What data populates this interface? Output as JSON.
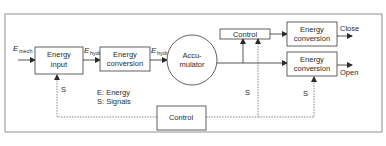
{
  "diagram": {
    "blocks": {
      "energy_input": {
        "line1": "Energy",
        "line2": "input"
      },
      "energy_conversion_1": {
        "line1": "Energy",
        "line2": "conversion"
      },
      "accumulator": {
        "line1": "Accu-",
        "line2": "mulator"
      },
      "control_top": {
        "label": "Control"
      },
      "energy_conversion_close": {
        "line1": "Energy",
        "line2": "conversion"
      },
      "energy_conversion_open": {
        "line1": "Energy",
        "line2": "conversion"
      },
      "control_bottom": {
        "label": "Control"
      }
    },
    "flows": {
      "e_mech": {
        "main": "E",
        "sub": "mech"
      },
      "e_hydr_1": {
        "main": "E",
        "sub": "hydr"
      },
      "e_hydr_2": {
        "main": "E",
        "sub": "hydr"
      }
    },
    "outputs": {
      "close": "Close",
      "open": "Open"
    },
    "signals": {
      "s_left": "S",
      "s_mid": "S",
      "s_right": "S"
    },
    "legend": {
      "energy": "E: Energy",
      "signals": "S: Signals"
    },
    "colors": {
      "line": "#3a3a3a",
      "frame": "#777777",
      "box_fill": "#ffffff"
    }
  }
}
